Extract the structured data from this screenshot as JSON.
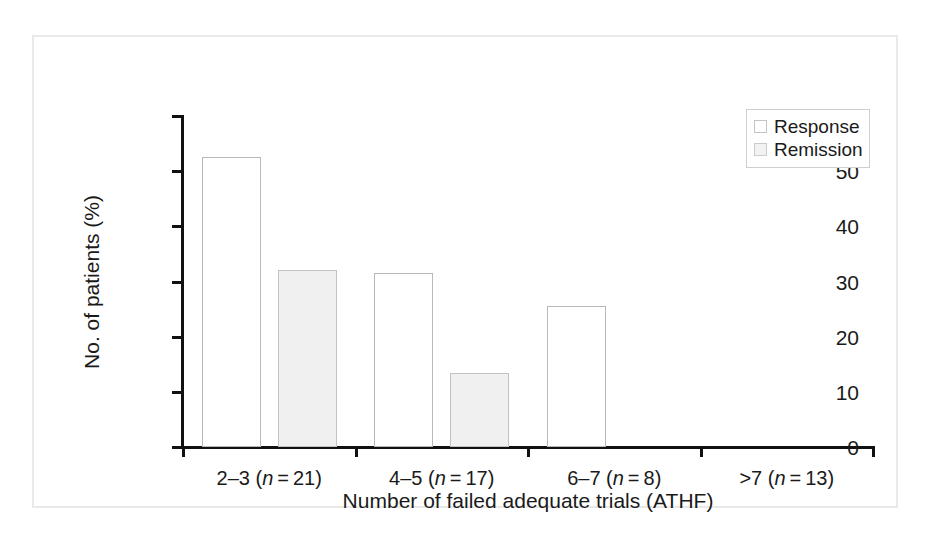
{
  "figure": {
    "frame_color": "#e9e9e9",
    "background": "#ffffff"
  },
  "chart_data": {
    "type": "bar",
    "title": "",
    "xlabel": "Number of failed adequate trials (ATHF)",
    "ylabel": "No. of patients (%)",
    "categories": [
      "2–3 (n = 21)",
      "4–5 (n = 17)",
      "6–7 (n = 8)",
      ">7 (n = 13)"
    ],
    "category_parts": [
      {
        "range": "2–3",
        "n_prefix": "(",
        "n_italic": "n",
        "n_rest": " = 21)"
      },
      {
        "range": "4–5",
        "n_prefix": "(",
        "n_italic": "n",
        "n_rest": " = 17)"
      },
      {
        "range": "6–7",
        "n_prefix": "(",
        "n_italic": "n",
        "n_rest": " = 8)"
      },
      {
        "range": ">7",
        "n_prefix": "(",
        "n_italic": "n",
        "n_rest": " = 13)"
      }
    ],
    "group_n": [
      21,
      17,
      8,
      13
    ],
    "series": [
      {
        "name": "Response",
        "values": [
          52.5,
          31.5,
          25.5,
          0
        ],
        "fill": "#ffffff",
        "border": "#b9b9b9"
      },
      {
        "name": "Remission",
        "values": [
          32.0,
          13.5,
          0.0,
          0
        ],
        "fill": "#f0f0f0",
        "border": "#c2c2c2"
      }
    ],
    "ylim": [
      0,
      60
    ],
    "yticks": [
      0,
      10,
      20,
      30,
      40,
      50,
      60
    ],
    "ytick_labels": [
      "0",
      "10",
      "20",
      "30",
      "40",
      "50",
      "60"
    ],
    "grid": false,
    "legend_position": "top-right",
    "legend_entries": [
      "Response",
      "Remission"
    ]
  }
}
